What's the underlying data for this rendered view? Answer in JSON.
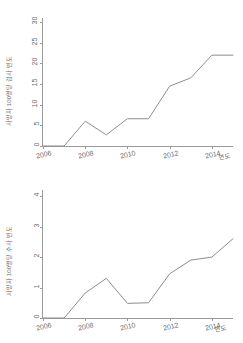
{
  "chart_data": [
    {
      "type": "line",
      "panel": "top",
      "title": "",
      "xlabel": "연도",
      "ylabel": "사망자 100명당 검사 빈도",
      "x": [
        2006,
        2007,
        2008,
        2009,
        2010,
        2011,
        2012,
        2013,
        2014,
        2015
      ],
      "values": [
        0,
        0,
        6.0,
        2.7,
        6.6,
        6.6,
        14.5,
        16.5,
        22.0,
        22.0
      ],
      "xlim": [
        2006,
        2015
      ],
      "ylim": [
        0,
        31
      ],
      "yticks": [
        0,
        5,
        10,
        15,
        20,
        25,
        30
      ],
      "ytick_labels": [
        "0",
        "5",
        "10",
        "15",
        "20",
        "25",
        "30"
      ],
      "xticks": [
        2006,
        2008,
        2010,
        2012,
        2014
      ],
      "xtick_labels": [
        "2006",
        "2008",
        "2010",
        "2012",
        "2014"
      ],
      "grid": false,
      "legend": null,
      "line_color": "#8e8e8e"
    },
    {
      "type": "line",
      "panel": "bottom",
      "title": "",
      "xlabel": "연도",
      "ylabel": "사망자 100명당 수사 빈도",
      "x": [
        2006,
        2007,
        2008,
        2009,
        2010,
        2011,
        2012,
        2013,
        2014,
        2015
      ],
      "values": [
        0,
        0,
        0.82,
        1.3,
        0.48,
        0.5,
        1.45,
        1.9,
        2.0,
        2.6
      ],
      "xlim": [
        2006,
        2015
      ],
      "ylim": [
        0,
        4.2
      ],
      "yticks": [
        0,
        1,
        2,
        3,
        4
      ],
      "ytick_labels": [
        "0",
        "1",
        "2",
        "3",
        "4"
      ],
      "xticks": [
        2006,
        2008,
        2010,
        2012,
        2014
      ],
      "xtick_labels": [
        "2006",
        "2008",
        "2010",
        "2012",
        "2014"
      ],
      "grid": false,
      "legend": null,
      "line_color": "#8e8e8e"
    }
  ]
}
